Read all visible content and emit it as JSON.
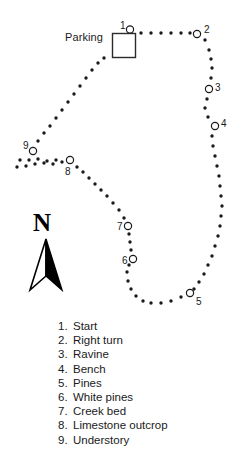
{
  "map": {
    "parking_label": "Parking",
    "north_letter": "N",
    "markers": [
      {
        "id": "1",
        "label": "1",
        "cx": 130,
        "cy": 29.5,
        "lx": 120,
        "ly": 21
      },
      {
        "id": "2",
        "label": "2",
        "cx": 197,
        "cy": 34,
        "lx": 204,
        "ly": 25
      },
      {
        "id": "3",
        "label": "3",
        "cx": 209,
        "cy": 89,
        "lx": 215,
        "ly": 83
      },
      {
        "id": "4",
        "label": "4",
        "cx": 215,
        "cy": 126,
        "lx": 221,
        "ly": 119
      },
      {
        "id": "5",
        "label": "5",
        "cx": 190,
        "cy": 293,
        "lx": 196,
        "ly": 297
      },
      {
        "id": "6",
        "label": "6",
        "cx": 133,
        "cy": 259,
        "lx": 122,
        "ly": 256
      },
      {
        "id": "7",
        "label": "7",
        "cx": 128,
        "cy": 226,
        "lx": 117,
        "ly": 222
      },
      {
        "id": "8",
        "label": "8",
        "cx": 70,
        "cy": 160,
        "lx": 65,
        "ly": 167
      },
      {
        "id": "9",
        "label": "9",
        "cx": 33,
        "cy": 151,
        "lx": 23,
        "ly": 141
      }
    ]
  },
  "legend": {
    "items": [
      {
        "num": "1.",
        "text": "Start"
      },
      {
        "num": "2.",
        "text": "Right turn"
      },
      {
        "num": "3.",
        "text": "Ravine"
      },
      {
        "num": "4.",
        "text": "Bench"
      },
      {
        "num": "5.",
        "text": "Pines"
      },
      {
        "num": "6.",
        "text": "White pines"
      },
      {
        "num": "7.",
        "text": "Creek bed"
      },
      {
        "num": "8.",
        "text": "Limestone outcrop"
      },
      {
        "num": "9.",
        "text": "Understory"
      }
    ]
  },
  "chart_data": {
    "type": "scatter",
    "title": "",
    "xlabel": "",
    "ylabel": "",
    "grid": false,
    "legend_position": "bottom",
    "trail_dots": [
      [
        141,
        33
      ],
      [
        151,
        33
      ],
      [
        161,
        33
      ],
      [
        171,
        33
      ],
      [
        181,
        33
      ],
      [
        190,
        33
      ],
      [
        205,
        40
      ],
      [
        209,
        50
      ],
      [
        211,
        59
      ],
      [
        212,
        68
      ],
      [
        211,
        78
      ],
      [
        207,
        99
      ],
      [
        205,
        108
      ],
      [
        208,
        117
      ],
      [
        212,
        136
      ],
      [
        213,
        146
      ],
      [
        215,
        156
      ],
      [
        217,
        166
      ],
      [
        219,
        176
      ],
      [
        220,
        186
      ],
      [
        221,
        196
      ],
      [
        222,
        206
      ],
      [
        221,
        216
      ],
      [
        220,
        226
      ],
      [
        218,
        236
      ],
      [
        215,
        246
      ],
      [
        212,
        256
      ],
      [
        208,
        265
      ],
      [
        204,
        274
      ],
      [
        199,
        282
      ],
      [
        194,
        289
      ],
      [
        181,
        297
      ],
      [
        171,
        301
      ],
      [
        161,
        303
      ],
      [
        151,
        303
      ],
      [
        143,
        301
      ],
      [
        136,
        296
      ],
      [
        131,
        289
      ],
      [
        128,
        281
      ],
      [
        127,
        272
      ],
      [
        129,
        265
      ],
      [
        131,
        250
      ],
      [
        130,
        242
      ],
      [
        129,
        234
      ],
      [
        124,
        218
      ],
      [
        119,
        210
      ],
      [
        113,
        203
      ],
      [
        107,
        196
      ],
      [
        101,
        190
      ],
      [
        95,
        184
      ],
      [
        89,
        178
      ],
      [
        83,
        172
      ],
      [
        77,
        167
      ],
      [
        62,
        162
      ],
      [
        53,
        164
      ],
      [
        44,
        163
      ],
      [
        35,
        164
      ],
      [
        26,
        166
      ],
      [
        17,
        167
      ],
      [
        20,
        160
      ],
      [
        29,
        160
      ],
      [
        38,
        159
      ],
      [
        47,
        161
      ],
      [
        56,
        160
      ],
      [
        38,
        141
      ],
      [
        44,
        133
      ],
      [
        50,
        126
      ],
      [
        56,
        118
      ],
      [
        62,
        110
      ],
      [
        68,
        102
      ],
      [
        74,
        94
      ],
      [
        80,
        86
      ],
      [
        86,
        78
      ],
      [
        92,
        70
      ],
      [
        98,
        63
      ],
      [
        104,
        58
      ]
    ],
    "parking_rect": {
      "x": 112,
      "y": 33,
      "w": 23,
      "h": 24
    },
    "markers_xy": {
      "1": [
        130,
        29.5
      ],
      "2": [
        197,
        34
      ],
      "3": [
        209,
        89
      ],
      "4": [
        215,
        126
      ],
      "5": [
        190,
        293
      ],
      "6": [
        133,
        259
      ],
      "7": [
        128,
        226
      ],
      "8": [
        70,
        160
      ],
      "9": [
        33,
        151
      ]
    },
    "north_arrow": {
      "x": 46,
      "y_top": 240,
      "y_bottom": 290
    }
  }
}
